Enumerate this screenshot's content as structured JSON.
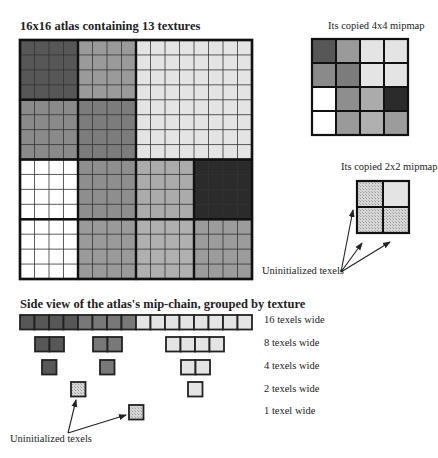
{
  "atlas": {
    "title": "16x16 atlas containing 13 textures",
    "size": 16,
    "blocks": [
      {
        "row": 0,
        "col": 0,
        "span": 1,
        "color": "#575757"
      },
      {
        "row": 0,
        "col": 1,
        "span": 1,
        "color": "#9a9a9a"
      },
      {
        "row": 0,
        "col": 2,
        "span": 2,
        "color": "#e4e4e4"
      },
      {
        "row": 1,
        "col": 0,
        "span": 1,
        "color": "#8a8a8a"
      },
      {
        "row": 1,
        "col": 1,
        "span": 1,
        "color": "#7c7c7c"
      },
      {
        "row": 2,
        "col": 0,
        "span": 1,
        "color": "#ffffff"
      },
      {
        "row": 2,
        "col": 1,
        "span": 1,
        "color": "#8e8e8e"
      },
      {
        "row": 2,
        "col": 2,
        "span": 1,
        "color": "#ababab"
      },
      {
        "row": 2,
        "col": 3,
        "span": 1,
        "color": "#2b2b2b"
      },
      {
        "row": 3,
        "col": 0,
        "span": 1,
        "color": "#ffffff"
      },
      {
        "row": 3,
        "col": 1,
        "span": 1,
        "color": "#9a9a9a"
      },
      {
        "row": 3,
        "col": 2,
        "span": 1,
        "color": "#b0b0b0"
      },
      {
        "row": 3,
        "col": 3,
        "span": 1,
        "color": "#9c9c9c"
      }
    ]
  },
  "mip4": {
    "title": "Its copied 4x4 mipmap",
    "cells": [
      [
        "#575757",
        "#9a9a9a",
        "#e4e4e4",
        "#e4e4e4"
      ],
      [
        "#8a8a8a",
        "#7c7c7c",
        "#e4e4e4",
        "#e4e4e4"
      ],
      [
        "#ffffff",
        "#8e8e8e",
        "#ababab",
        "#2b2b2b"
      ],
      [
        "#ffffff",
        "#9a9a9a",
        "#b0b0b0",
        "#9c9c9c"
      ]
    ]
  },
  "mip2": {
    "title": "Its copied 2x2 mipmap",
    "cells": [
      [
        "hatched",
        "#e4e4e4"
      ],
      [
        "hatched",
        "hatched"
      ]
    ],
    "annotation": "Uninitialized texels"
  },
  "side_view": {
    "title": "Side view of the atlas's mip-chain, grouped by texture",
    "rows": [
      {
        "label": "16 texels wide"
      },
      {
        "label": "8 texels wide"
      },
      {
        "label": "4 texels wide"
      },
      {
        "label": "2 texels wide"
      },
      {
        "label": "1 texel wide"
      }
    ],
    "annotation": "Uninitialized texels"
  },
  "colors": {
    "dark": "#575757",
    "mid": "#787878",
    "light": "#e4e4e4",
    "hatch": "#cfcfcf",
    "line": "#222222"
  }
}
